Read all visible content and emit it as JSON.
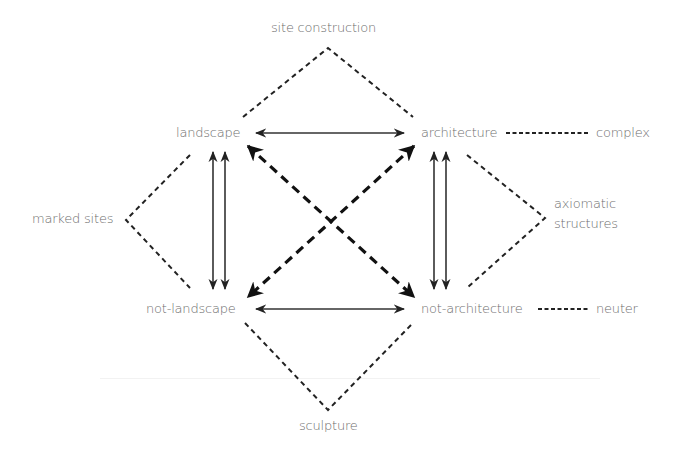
{
  "diagram": {
    "nodes": {
      "site_construction": "site construction",
      "landscape": "landscape",
      "architecture": "architecture",
      "complex": "complex",
      "marked_sites": "marked sites",
      "axiomatic_structures_line1": "axiomatic",
      "axiomatic_structures_line2": "structures",
      "not_landscape": "not-landscape",
      "not_architecture": "not-architecture",
      "neuter": "neuter",
      "sculpture": "sculpture"
    },
    "relations": [
      {
        "from": "landscape",
        "to": "architecture",
        "type": "bidirectional-solid"
      },
      {
        "from": "not-landscape",
        "to": "not-architecture",
        "type": "bidirectional-solid"
      },
      {
        "from": "landscape",
        "to": "not-landscape",
        "type": "double-vertical-bidirectional"
      },
      {
        "from": "architecture",
        "to": "not-architecture",
        "type": "double-vertical-bidirectional"
      },
      {
        "from": "landscape",
        "to": "not-architecture",
        "type": "bidirectional-dashed-diagonal"
      },
      {
        "from": "architecture",
        "to": "not-landscape",
        "type": "bidirectional-dashed-diagonal"
      },
      {
        "from": "landscape+architecture",
        "to": "site construction",
        "type": "dashed-bracket"
      },
      {
        "from": "landscape+not-landscape",
        "to": "marked sites",
        "type": "dashed-bracket"
      },
      {
        "from": "architecture+not-architecture",
        "to": "axiomatic structures",
        "type": "dashed-bracket"
      },
      {
        "from": "not-landscape+not-architecture",
        "to": "sculpture",
        "type": "dashed-bracket"
      },
      {
        "from": "architecture",
        "to": "complex",
        "type": "dashed-line"
      },
      {
        "from": "not-architecture",
        "to": "neuter",
        "type": "dashed-line"
      }
    ],
    "colors": {
      "line": "#222222",
      "text": "#6e6e6e",
      "background": "#ffffff"
    }
  }
}
